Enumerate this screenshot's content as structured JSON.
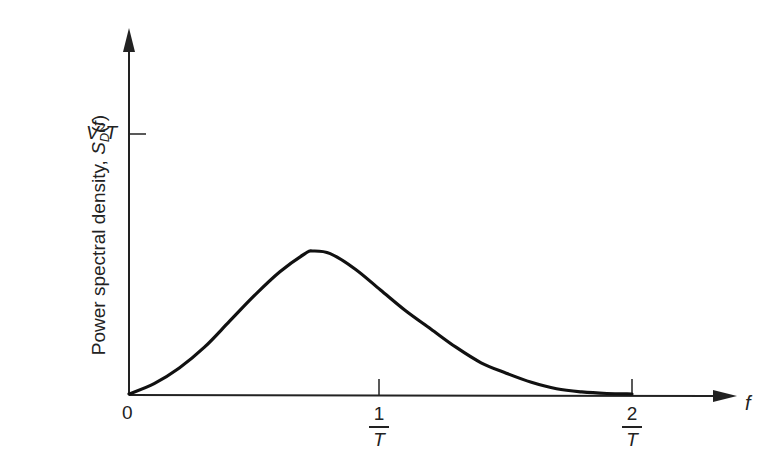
{
  "chart_data": {
    "type": "line",
    "title": "",
    "xlabel": "f",
    "ylabel": "Power spectral density, S_D(f)",
    "ylabel_parts": {
      "main": "Power spectral density, ",
      "symbol": "S",
      "subscript": "D",
      "arg": "(f)"
    },
    "x_ticks": [
      {
        "value": 0,
        "label": "0"
      },
      {
        "value": 1,
        "label_num": "1",
        "label_den": "T"
      },
      {
        "value": 2,
        "label_num": "2",
        "label_den": "T"
      }
    ],
    "y_ticks": [
      {
        "value": 1,
        "label": "V²T",
        "label_base": "V",
        "label_sup": "2",
        "label_tail": "T"
      }
    ],
    "x_units": "1/T",
    "y_units": "V²T",
    "xlim": [
      0,
      2.4
    ],
    "ylim": [
      0,
      1.4
    ],
    "grid": false,
    "legend": null,
    "series": [
      {
        "name": "S_D(f)",
        "x": [
          0,
          0.1,
          0.2,
          0.3,
          0.4,
          0.5,
          0.6,
          0.7,
          0.73,
          0.8,
          0.9,
          1.0,
          1.1,
          1.2,
          1.3,
          1.4,
          1.5,
          1.6,
          1.7,
          1.8,
          1.9,
          2.0
        ],
        "values": [
          0,
          0.04,
          0.1,
          0.18,
          0.28,
          0.38,
          0.47,
          0.54,
          0.55,
          0.54,
          0.48,
          0.4,
          0.32,
          0.25,
          0.18,
          0.12,
          0.08,
          0.045,
          0.02,
          0.008,
          0.002,
          0
        ]
      }
    ],
    "colors": {
      "line": "#111111",
      "axis": "#222222",
      "background": "#ffffff"
    }
  }
}
